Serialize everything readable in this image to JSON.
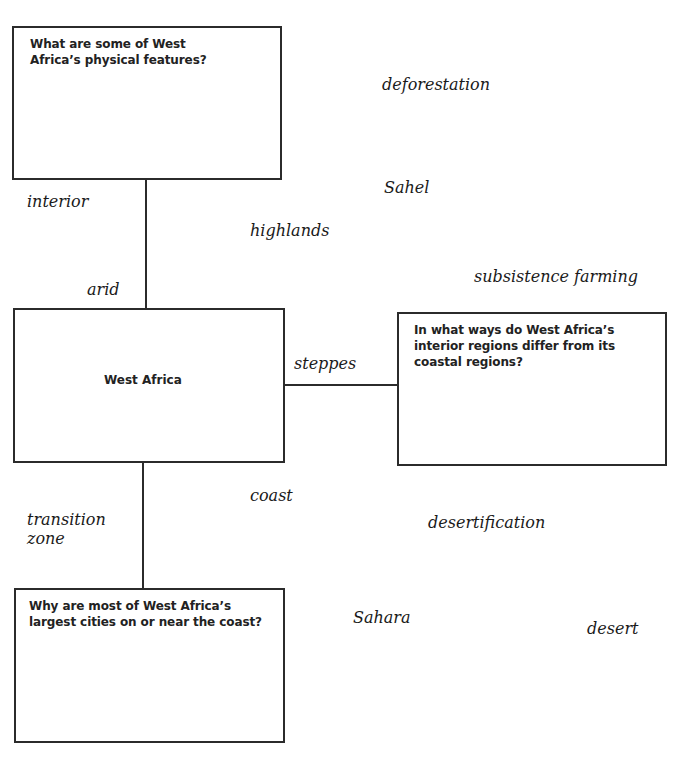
{
  "diagram": {
    "center_node": {
      "label": "West Africa"
    },
    "question_boxes": [
      {
        "id": "top",
        "prompt": "What are some of West Africa’s physical features?"
      },
      {
        "id": "right",
        "prompt": "In what ways do West Africa’s interior regions differ from its coastal regions?"
      },
      {
        "id": "bottom",
        "prompt": "Why are most of West Africa’s largest cities on or near the coast?"
      }
    ],
    "word_bank": [
      "deforestation",
      "Sahel",
      "interior",
      "highlands",
      "subsistence farming",
      "arid",
      "steppes",
      "coast",
      "transition zone",
      "desertification",
      "Sahara",
      "desert"
    ],
    "words": {
      "deforestation": "deforestation",
      "sahel": "Sahel",
      "interior": "interior",
      "highlands": "highlands",
      "subsistence_farming": "subsistence farming",
      "arid": "arid",
      "steppes": "steppes",
      "coast": "coast",
      "transition": "transition",
      "zone": "zone",
      "desertification": "desertification",
      "sahara": "Sahara",
      "desert": "desert"
    },
    "colors": {
      "line": "#2b2b2b",
      "text": "#1a1a1a",
      "background": "#ffffff"
    }
  }
}
